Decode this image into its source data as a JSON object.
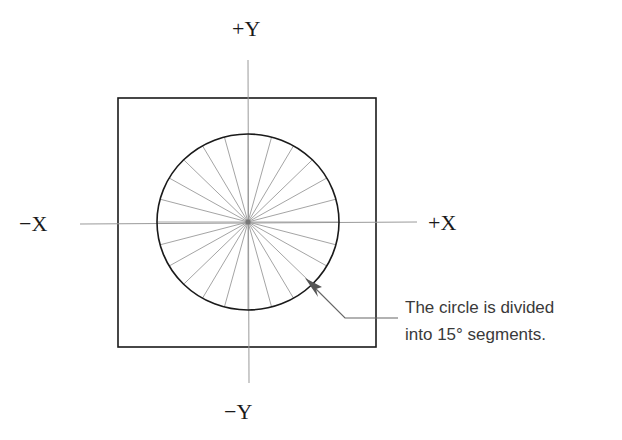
{
  "diagram": {
    "axes": {
      "plus_y": "+Y",
      "minus_y": "−Y",
      "plus_x": "+X",
      "minus_x": "−X"
    },
    "circle": {
      "segment_degrees": 15,
      "spoke_count": 24
    },
    "callout": {
      "line1": "The circle is divided",
      "line2": "into 15° segments."
    },
    "colors": {
      "frame": "#1a1a1a",
      "circle": "#1a1a1a",
      "axis": "#9a9a9a",
      "spoke": "#9a9a9a",
      "arrow": "#555555",
      "text": "#3a3a3a"
    }
  }
}
